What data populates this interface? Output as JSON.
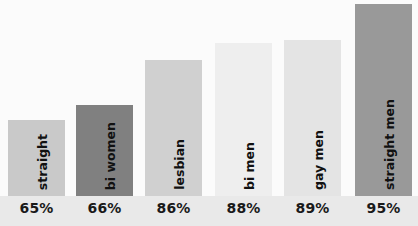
{
  "chart_data": {
    "type": "bar",
    "title": "",
    "subtitle": "",
    "xlabel": "",
    "ylabel": "",
    "ylim": [
      0,
      100
    ],
    "grid": false,
    "legend": "none",
    "value_suffix": "%",
    "categories": [
      "straight women",
      "bi women",
      "lesbian",
      "bi men",
      "gay men",
      "straight men"
    ],
    "values": [
      65,
      66,
      86,
      88,
      89,
      95
    ],
    "value_labels": [
      "65%",
      "66%",
      "86%",
      "88%",
      "89%",
      "95%"
    ],
    "bar_colors": [
      "#c9c9c9",
      "#808080",
      "#d0d0d0",
      "#eeeeee",
      "#e4e4e4",
      "#999999"
    ],
    "bars": [
      {
        "label": "straight women",
        "label_line1": "straight",
        "label_line2": "women",
        "value": 65,
        "value_label": "65%",
        "color": "#c9c9c9",
        "left": 8,
        "width": 57,
        "height": 76
      },
      {
        "label": "bi women",
        "label_line1": "bi women",
        "label_line2": "",
        "value": 66,
        "value_label": "66%",
        "color": "#808080",
        "left": 76,
        "width": 57,
        "height": 91
      },
      {
        "label": "lesbian",
        "label_line1": "lesbian",
        "label_line2": "",
        "value": 86,
        "value_label": "86%",
        "color": "#d0d0d0",
        "left": 145,
        "width": 57,
        "height": 136
      },
      {
        "label": "bi men",
        "label_line1": "bi men",
        "label_line2": "",
        "value": 88,
        "value_label": "88%",
        "color": "#eeeeee",
        "left": 215,
        "width": 57,
        "height": 153
      },
      {
        "label": "gay men",
        "label_line1": "gay men",
        "label_line2": "",
        "value": 89,
        "value_label": "89%",
        "color": "#e4e4e4",
        "left": 284,
        "width": 57,
        "height": 156
      },
      {
        "label": "straight men",
        "label_line1": "straight men",
        "label_line2": "",
        "value": 95,
        "value_label": "95%",
        "color": "#999999",
        "left": 355,
        "width": 57,
        "height": 192
      }
    ]
  },
  "colors": {
    "background": "#fbfbfb",
    "axis_strip": "#e9e9e9",
    "text": "#1a1a1a"
  }
}
